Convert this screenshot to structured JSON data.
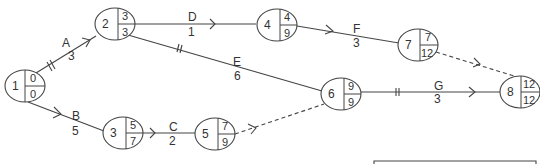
{
  "diagram": {
    "type": "activity-on-arrow network",
    "stroke_color": "#444444",
    "nodes": [
      {
        "id": "1",
        "earliest": "0",
        "latest": "0"
      },
      {
        "id": "2",
        "earliest": "3",
        "latest": "3"
      },
      {
        "id": "3",
        "earliest": "5",
        "latest": "7"
      },
      {
        "id": "4",
        "earliest": "4",
        "latest": "9"
      },
      {
        "id": "5",
        "earliest": "7",
        "latest": "9"
      },
      {
        "id": "6",
        "earliest": "9",
        "latest": "9"
      },
      {
        "id": "7",
        "earliest": "7",
        "latest": "12"
      },
      {
        "id": "8",
        "earliest": "12",
        "latest": "12"
      }
    ],
    "activities": [
      {
        "name": "A",
        "duration": "3",
        "from": "1",
        "to": "2",
        "critical": true
      },
      {
        "name": "B",
        "duration": "5",
        "from": "1",
        "to": "3",
        "critical": false
      },
      {
        "name": "C",
        "duration": "2",
        "from": "3",
        "to": "5",
        "critical": false
      },
      {
        "name": "D",
        "duration": "1",
        "from": "2",
        "to": "4",
        "critical": false
      },
      {
        "name": "E",
        "duration": "6",
        "from": "2",
        "to": "6",
        "critical": true
      },
      {
        "name": "F",
        "duration": "3",
        "from": "4",
        "to": "7",
        "critical": false
      },
      {
        "name": "G",
        "duration": "3",
        "from": "6",
        "to": "8",
        "critical": true
      }
    ],
    "dummies": [
      {
        "from": "5",
        "to": "6"
      },
      {
        "from": "7",
        "to": "8"
      }
    ]
  }
}
